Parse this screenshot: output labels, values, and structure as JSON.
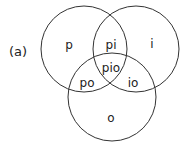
{
  "figure_label": "(a)",
  "circles": [
    {
      "name": "p",
      "cx": 84,
      "cy": 49,
      "r": 43
    },
    {
      "name": "i",
      "cx": 136,
      "cy": 49,
      "r": 43
    },
    {
      "name": "o",
      "cx": 113,
      "cy": 97,
      "r": 45
    }
  ],
  "regions": {
    "p": "p",
    "i": "i",
    "o": "o",
    "pi": "pi",
    "po": "po",
    "io": "io",
    "pio": "pio"
  },
  "stroke_color": "#333333"
}
